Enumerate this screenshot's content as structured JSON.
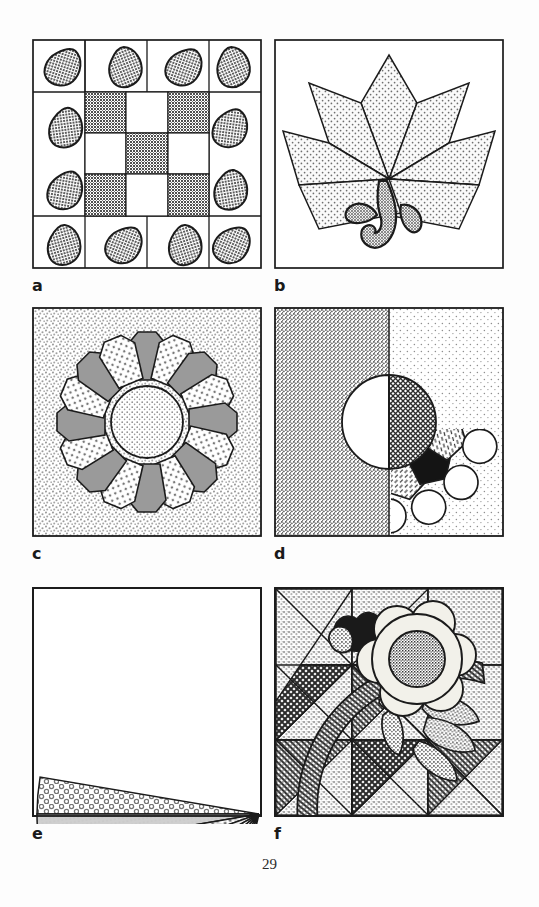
{
  "document": {
    "type": "book-page",
    "page_number": "29",
    "content_kind": "quilt block pattern illustrations",
    "panel_count": 6
  },
  "figures": [
    {
      "id": "a",
      "label": "a",
      "name": "nine-patch-with-corner-petals",
      "description": "Nine-patch checkerboard center block framed by a grid of twelve border squares, each holding an appliqued teardrop petal",
      "grid": "5 x 5 block grid",
      "center_checkerboard": {
        "rows": 3,
        "cols": 3,
        "pattern": [
          [
            "dark",
            "light",
            "dark"
          ],
          [
            "light",
            "dark",
            "light"
          ],
          [
            "dark",
            "light",
            "dark"
          ]
        ]
      },
      "petals": {
        "count": 12,
        "fill": "stippled-gray",
        "shape": "teardrop"
      },
      "colors": {
        "dark": "#6d6d6d",
        "light": "#ffffff",
        "petal": "#8a8a8a",
        "ink": "#1b1b1b"
      }
    },
    {
      "id": "b",
      "label": "b",
      "name": "six-diamond-star-leaf-with-stem",
      "description": "Six stippled diamonds radiating from a common point forming a leaf-like star, with a curved appliqued stem and two small leaves below",
      "diamond_count": 6,
      "stem": {
        "shape": "curved hook",
        "fill": "stippled-gray"
      },
      "leaves": {
        "count": 2,
        "fill": "stippled-gray"
      },
      "colors": {
        "diamond": "#f2f2f2",
        "stipple": "#7a7a7a",
        "stem": "#8a8a8a",
        "ink": "#1b1b1b"
      }
    },
    {
      "id": "c",
      "label": "c",
      "name": "dresden-plate",
      "description": "Dresden Plate: sixteen wedge petals alternating solid gray and dotted white around a dotted center circle, on a stippled background",
      "petal_count": 16,
      "petal_sequence": [
        "solid-gray",
        "dotted-white"
      ],
      "center": {
        "shape": "circle",
        "fill": "fine-stipple"
      },
      "background": "fine-stipple",
      "colors": {
        "petal_gray": "#9a9a9a",
        "petal_white": "#ffffff",
        "background": "#efefef",
        "ink": "#1b1b1b"
      }
    },
    {
      "id": "d",
      "label": "d",
      "name": "split-sunburst-compass",
      "description": "Block split vertically down the middle: left half is a scalloped circle of rounded petals over dark stipple, right half is a pointed mariner's compass star over light stipple; center circle is half white, half cross-hatched",
      "left_half": {
        "background": "dark-stipple",
        "ring_outer": {
          "count": 12,
          "shape": "circle",
          "fill": "white"
        },
        "ring_inner": {
          "count": 10,
          "shape": "hexagon petal",
          "fill_sequence": [
            "black",
            "hatched-white"
          ]
        }
      },
      "right_half": {
        "background": "light-stipple",
        "rays": {
          "count": 8,
          "fill_sequence": [
            "black",
            "white"
          ]
        }
      },
      "center": {
        "shape": "circle",
        "left_fill": "white",
        "right_fill": "cross-hatch"
      },
      "colors": {
        "black": "#141414",
        "white": "#ffffff",
        "dark_stipple": "#b9b9b9",
        "light_stipple": "#eaeaea",
        "ink": "#1b1b1b"
      }
    },
    {
      "id": "e",
      "label": "e",
      "name": "grandmothers-fan",
      "description": "Grandmother's Fan: nine textured wedges radiating from the lower-right corner filling a quarter circle",
      "wedge_count": 9,
      "wedge_textures": [
        "ring-dots",
        "solid-light-gray",
        "diagonal-dot-weave",
        "plain-light",
        "small-ring-dots",
        "fine-dots",
        "medium-dots",
        "dense-speckle",
        "sparse-flecks"
      ],
      "pivot": "bottom-right corner",
      "sweep_degrees": 90,
      "colors": {
        "ink": "#1b1b1b",
        "light": "#efefef",
        "mid": "#c9c9c9",
        "dark": "#9a9a9a"
      }
    },
    {
      "id": "f",
      "label": "f",
      "name": "floral-applique-over-half-square-triangles",
      "description": "Pieced field of half-square triangle squares in light and dark textures, overlaid with an appliqued flower, bud, leaves and a woven basket-handle arc",
      "triangle_grid": {
        "rows": 3,
        "cols": 3,
        "unit": "half-square triangle"
      },
      "applique": {
        "flower": {
          "petal_count": 6,
          "petal_fill": "pale-cream",
          "center_fill": "dark-speckle"
        },
        "bud": {
          "fill": "black",
          "lobes": 2
        },
        "leaves": {
          "count": 5,
          "fill": "medium-speckle"
        },
        "handle_arc": {
          "fill": "basket-weave-hatch"
        }
      },
      "colors": {
        "light": "#d9d9d9",
        "dark": "#4a4a4a",
        "cream": "#f0efe8",
        "black": "#1a1a1a",
        "ink": "#1b1b1b"
      }
    }
  ]
}
